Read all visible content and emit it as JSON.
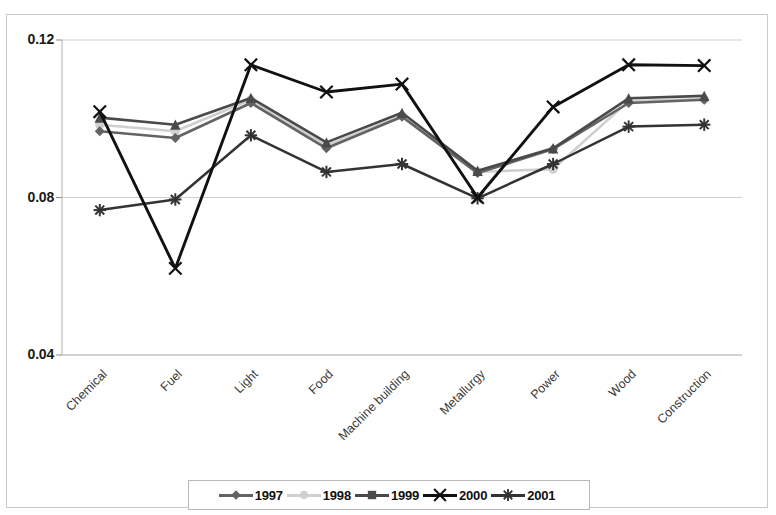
{
  "chart_data": {
    "type": "line",
    "title": "",
    "xlabel": "",
    "ylabel": "",
    "ylim": [
      0.04,
      0.12
    ],
    "yticks": [
      "0.04",
      "0.08",
      "0.12"
    ],
    "grid": true,
    "legend_position": "bottom",
    "categories": [
      "Chemical",
      "Fuel",
      "Light",
      "Food",
      "Machine building",
      "Metallurgy",
      "Power",
      "Wood",
      "Construction"
    ],
    "series": [
      {
        "name": "1997",
        "marker": "diamond",
        "color": "#636363",
        "values": [
          0.0968,
          0.0951,
          0.104,
          0.0925,
          0.1005,
          0.0862,
          0.0923,
          0.104,
          0.1048
        ]
      },
      {
        "name": "1998",
        "marker": "circle",
        "color": "#cfcfcf",
        "values": [
          0.0985,
          0.0968,
          0.1048,
          0.0932,
          0.1008,
          0.0865,
          0.0872,
          0.1045,
          0.105
        ]
      },
      {
        "name": "1999",
        "marker": "square",
        "color": "#4a4a4a",
        "values": [
          0.1003,
          0.0985,
          0.1053,
          0.094,
          0.1015,
          0.0868,
          0.0925,
          0.1052,
          0.1058
        ]
      },
      {
        "name": "2000",
        "marker": "x",
        "color": "#111111",
        "values": [
          0.1018,
          0.062,
          0.1137,
          0.1068,
          0.1088,
          0.08,
          0.103,
          0.1137,
          0.1135
        ]
      },
      {
        "name": "2001",
        "marker": "asterisk",
        "color": "#333333",
        "values": [
          0.0768,
          0.0795,
          0.0958,
          0.0865,
          0.0885,
          0.0798,
          0.0885,
          0.098,
          0.0985
        ]
      }
    ]
  },
  "legend": {
    "entries": [
      {
        "label": "1997"
      },
      {
        "label": "1998"
      },
      {
        "label": "1999"
      },
      {
        "label": "2000"
      },
      {
        "label": "2001"
      }
    ]
  }
}
